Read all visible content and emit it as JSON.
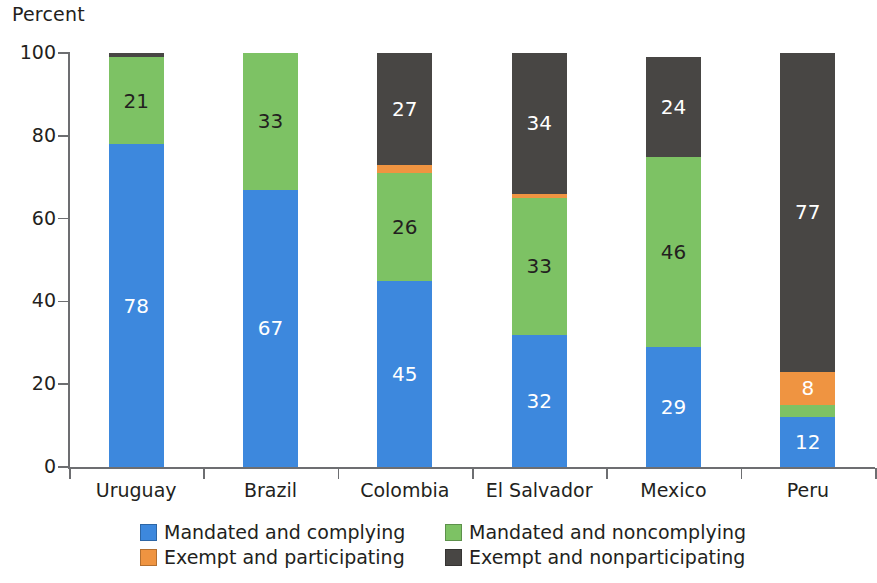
{
  "chart_data": {
    "type": "bar",
    "title": "",
    "subtitle": "",
    "ylabel": "Percent",
    "xlabel": "",
    "ylim": [
      0,
      100
    ],
    "yticks": [
      0,
      20,
      40,
      60,
      80,
      100
    ],
    "grid": false,
    "stacked": true,
    "stack_total": 100,
    "legend_position": "bottom",
    "categories": [
      "Uruguay",
      "Brazil",
      "Colombia",
      "El Salvador",
      "Mexico",
      "Peru"
    ],
    "series": [
      {
        "name": "Mandated and complying",
        "color": "#3d88dd",
        "values": [
          78,
          67,
          45,
          32,
          29,
          12
        ],
        "labels": [
          "78",
          "67",
          "45",
          "32",
          "29",
          "12"
        ]
      },
      {
        "name": "Mandated and noncomplying",
        "color": "#7dc264",
        "values": [
          21,
          33,
          26,
          33,
          46,
          3
        ],
        "labels": [
          "21",
          "33",
          "26",
          "33",
          "46",
          ""
        ]
      },
      {
        "name": "Exempt and participating",
        "color": "#ef9441",
        "values": [
          0,
          0,
          2,
          1,
          0,
          8
        ],
        "labels": [
          "",
          "",
          "",
          "",
          "",
          "8"
        ]
      },
      {
        "name": "Exempt and nonparticipating",
        "color": "#484644",
        "values": [
          1,
          0,
          27,
          34,
          24,
          77
        ],
        "labels": [
          "",
          "",
          "27",
          "34",
          "24",
          "77"
        ]
      }
    ]
  },
  "axis": {
    "y_title": "Percent",
    "y_tick_labels": [
      "100",
      "80",
      "60",
      "40",
      "20",
      "0"
    ],
    "x_tick_labels": [
      "Uruguay",
      "Brazil",
      "Colombia",
      "El Salvador",
      "Mexico",
      "Peru"
    ]
  },
  "legend": {
    "items": [
      {
        "label": "Mandated and complying",
        "color": "#3d88dd"
      },
      {
        "label": "Mandated and noncomplying",
        "color": "#7dc264"
      },
      {
        "label": "Exempt and participating",
        "color": "#ef9441"
      },
      {
        "label": "Exempt and nonparticipating",
        "color": "#484644"
      }
    ]
  },
  "colors": {
    "blue": "#3d88dd",
    "green": "#7dc264",
    "orange": "#ef9441",
    "dark": "#484644",
    "axis": "#6d6e71",
    "text": "#231f20",
    "background": "#ffffff"
  }
}
